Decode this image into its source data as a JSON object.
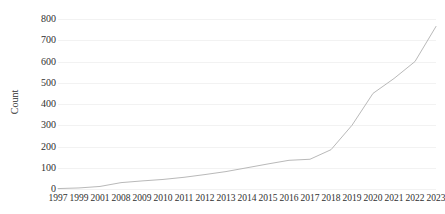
{
  "chart_data": {
    "type": "line",
    "title": "",
    "subtitle": "",
    "xlabel": "",
    "ylabel": "Count",
    "categories": [
      "1997",
      "1999",
      "2001",
      "2008",
      "2009",
      "2010",
      "2011",
      "2012",
      "2013",
      "2014",
      "2015",
      "2016",
      "2017",
      "2018",
      "2019",
      "2020",
      "2021",
      "2022",
      "2023"
    ],
    "values": [
      2,
      5,
      12,
      30,
      38,
      45,
      55,
      68,
      82,
      100,
      118,
      135,
      140,
      185,
      300,
      450,
      520,
      600,
      765
    ],
    "series": [
      {
        "name": "Count",
        "values": [
          2,
          5,
          12,
          30,
          38,
          45,
          55,
          68,
          82,
          100,
          118,
          135,
          140,
          185,
          300,
          450,
          520,
          600,
          765
        ]
      }
    ],
    "ylim": [
      0,
      800
    ],
    "yticks": [
      0,
      100,
      200,
      300,
      400,
      500,
      600,
      700,
      800
    ],
    "ytick_labels": [
      "0",
      "100",
      "200",
      "300",
      "400",
      "500",
      "600",
      "700",
      "800"
    ],
    "grid": true,
    "grid_axis": "y",
    "legend": false,
    "legend_position": "none",
    "line_color": "#b9b9b9",
    "line_width": 1,
    "markers": false,
    "background_color": "#ffffff",
    "axis_text_color": "#2f2f2f"
  }
}
